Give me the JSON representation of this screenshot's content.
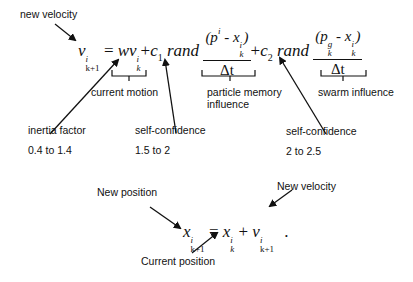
{
  "velocity_equation": {
    "lhs_var": "v",
    "lhs_sup": "i",
    "lhs_sub": "k+1",
    "eq": "=",
    "w": "w",
    "v": "v",
    "v_sup": "i",
    "v_sub": "k",
    "plus1": "+",
    "c1": "c",
    "c1_sub": "1",
    "rand1": "rand",
    "frac1_num": "(p",
    "frac1_num_sup": "i",
    "frac1_minus": " - x",
    "frac1_x_sup": "i",
    "frac1_x_sub": "k",
    "frac1_close": ")",
    "frac1_den": "Δt",
    "plus2": "+",
    "c2": "c",
    "c2_sub": "2",
    "rand2": "rand",
    "frac2_num": "(p",
    "frac2_p_sup": "g",
    "frac2_p_sub": "k",
    "frac2_minus": " - x",
    "frac2_x_sup": "i",
    "frac2_x_sub": "k",
    "frac2_close": ")",
    "frac2_den": "Δt"
  },
  "position_equation": {
    "lhs_var": "x",
    "lhs_sup": "i",
    "lhs_sub": "k+1",
    "eq": "=",
    "x": "x",
    "x_sup": "i",
    "x_sub": "k",
    "plus": "+",
    "v": "v",
    "v_sup": "i",
    "v_sub": "k+1",
    "period": "."
  },
  "labels": {
    "new_velocity_top": "new  velocity",
    "current_motion": "current  motion",
    "particle_memory_1": "particle memory",
    "particle_memory_2": "influence",
    "swarm_influence": "swarm  influence",
    "inertia_factor": "inertia  factor",
    "inertia_range": "0.4 to 1.4",
    "self_confidence_1": "self-confidence",
    "self_confidence_1_range": "1.5 to 2",
    "self_confidence_2": "self-confidence",
    "self_confidence_2_range": "2 to 2.5",
    "new_position": "New position",
    "new_velocity_bottom": "New velocity",
    "current_position": "Current position"
  }
}
